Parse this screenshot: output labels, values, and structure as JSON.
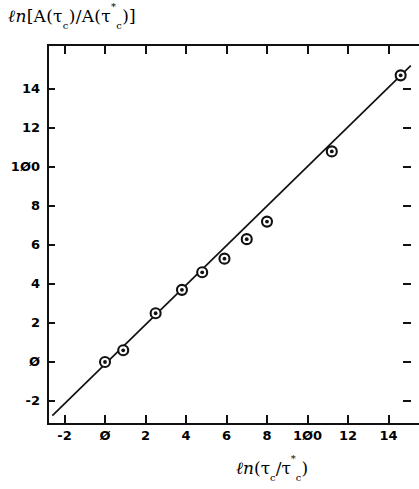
{
  "chart_data": {
    "type": "scatter",
    "title": "",
    "ylabel": "ln[A(tau_c)/A(tau_c*)]",
    "xlabel": "ln(tau_c/tau_c*)",
    "xlim": [
      -2.8,
      15.2
    ],
    "ylim": [
      -3.4,
      15.3
    ],
    "xticks": [
      -2,
      0,
      2,
      4,
      6,
      8,
      10,
      12,
      14
    ],
    "yticks": [
      -2,
      0,
      2,
      4,
      6,
      8,
      10,
      12,
      14
    ],
    "grid": false,
    "legend": null,
    "marker": "circle-with-dot",
    "x": [
      0.0,
      0.9,
      2.5,
      3.8,
      4.8,
      5.9,
      7.0,
      8.0,
      11.2,
      14.6
    ],
    "y": [
      0.0,
      0.6,
      2.5,
      3.7,
      4.6,
      5.3,
      6.3,
      7.2,
      10.8,
      14.7
    ],
    "series": [
      {
        "name": "data",
        "points": [
          [
            0.0,
            0.0
          ],
          [
            0.9,
            0.6
          ],
          [
            2.5,
            2.5
          ],
          [
            3.8,
            3.7
          ],
          [
            4.8,
            4.6
          ],
          [
            5.9,
            5.3
          ],
          [
            7.0,
            6.3
          ],
          [
            8.0,
            7.2
          ],
          [
            11.2,
            10.8
          ],
          [
            14.6,
            14.7
          ]
        ]
      },
      {
        "name": "fit-line",
        "type": "line",
        "endpoints": [
          [
            -2.6,
            -2.75
          ],
          [
            15.1,
            15.2
          ]
        ],
        "slope": 1.01,
        "intercept": -0.13
      }
    ]
  },
  "axes": {
    "y_tick_labels": [
      "14",
      "12",
      "1Ø0",
      "8",
      "6",
      "4",
      "2",
      "Ø",
      "-2"
    ],
    "x_tick_labels": [
      "-2",
      "Ø",
      "2",
      "4",
      "6",
      "8",
      "1Ø0",
      "12",
      "14"
    ],
    "y_title": {
      "ln": "ℓn",
      "body_open": "[A(",
      "tau1": "τ",
      "sub1": "c",
      "mid": ")/A(",
      "tau2": "τ",
      "sub2": "c",
      "star": "*",
      "close": ")]"
    },
    "x_title": {
      "ln": "ℓn",
      "body_open": "(",
      "tau1": "τ",
      "sub1": "c",
      "mid": "/",
      "tau2": "τ",
      "sub2": "c",
      "star": "*",
      "close": ")"
    }
  },
  "colors": {
    "axis": "#111111",
    "marker": "#111111",
    "line": "#111111",
    "background": "#ffffff"
  }
}
